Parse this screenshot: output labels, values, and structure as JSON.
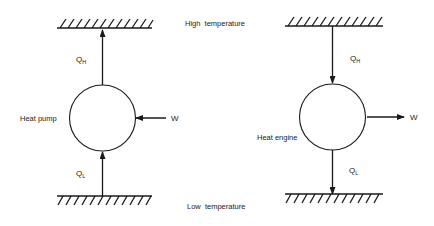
{
  "diagram": {
    "center_labels": {
      "high_temperature": "High  temperature",
      "low_temperature": "Low  temperature"
    },
    "heat_pump": {
      "label": "Heat pump",
      "q_high": {
        "symbol": "Q",
        "subscript": "H",
        "direction": "up (into high-temperature reservoir)"
      },
      "q_low": {
        "symbol": "Q",
        "subscript": "L",
        "direction": "up (from low-temperature reservoir)"
      },
      "work": {
        "label": "W",
        "direction": "in"
      }
    },
    "heat_engine": {
      "label": "Heat engine",
      "q_high": {
        "symbol": "Q",
        "subscript": "H",
        "direction": "down (from high-temperature reservoir)"
      },
      "q_low": {
        "symbol": "Q",
        "subscript": "L",
        "direction": "down (into low-temperature reservoir)"
      },
      "work": {
        "label": "W",
        "direction": "out"
      }
    },
    "colors": {
      "line": "#1a1a1a",
      "background": "#ffffff"
    }
  }
}
